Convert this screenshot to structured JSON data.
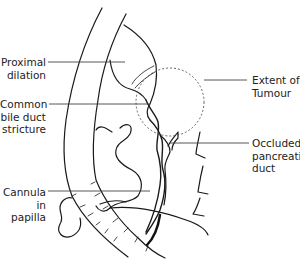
{
  "diagram": {
    "type": "anatomical-line-drawing",
    "line_color": "#1a1a1a",
    "leader_color": "#444444",
    "background": "#ffffff"
  },
  "labels": {
    "proximal_dilation": {
      "line1": "Proximal",
      "line2": "dilation"
    },
    "cbd_stricture": {
      "line1": "Common",
      "line2": "bile duct",
      "line3": "stricture"
    },
    "cannula": {
      "line1": "Cannula",
      "line2": "in papilla"
    },
    "tumour": {
      "line1": "Extent of",
      "line2": "Tumour"
    },
    "pancreatic_duct": {
      "line1": "Occluded",
      "line2": "pancreatic",
      "line3": "duct"
    }
  }
}
